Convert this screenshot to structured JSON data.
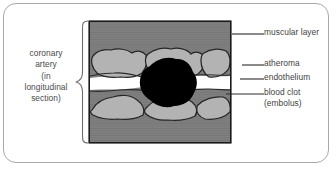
{
  "figure": {
    "width": 336,
    "height": 169,
    "background_color": "#ffffff",
    "border_color": "#a9a9ab"
  },
  "caption_left": {
    "name": "coronary-artery-caption",
    "lines": [
      "coronary",
      "artery",
      "(in",
      "longitudinal",
      "section)"
    ],
    "text_color": "#4a4a4c"
  },
  "brace": {
    "name": "left-curly-brace",
    "color": "#6e6e70"
  },
  "diagram": {
    "name": "artery-cross-section",
    "frame_color": "#1a1a1a",
    "muscular_layer_color": "#808080",
    "muscular_layer_texture_color": "#767676",
    "atheroma_color": "#b3b3b3",
    "atheroma_outline_color": "#262626",
    "endothelium_color": "#2b2b2b",
    "lumen_color": "#ffffff",
    "blood_clot_color": "#000000"
  },
  "labels_right": [
    {
      "name": "label-muscular-layer",
      "lines": [
        "muscular layer"
      ],
      "leader_y": 14,
      "text_y": 8
    },
    {
      "name": "label-atheroma",
      "lines": [
        "atheroma"
      ],
      "leader_y": 45,
      "text_y": 39
    },
    {
      "name": "label-endothelium",
      "lines": [
        "endothelium"
      ],
      "leader_y": 59,
      "text_y": 53
    },
    {
      "name": "label-blood-clot",
      "lines": [
        "blood clot",
        "(embolus)"
      ],
      "leader_y": 74,
      "text_y": 68
    }
  ],
  "leader_line_color": "#2a2a2a"
}
